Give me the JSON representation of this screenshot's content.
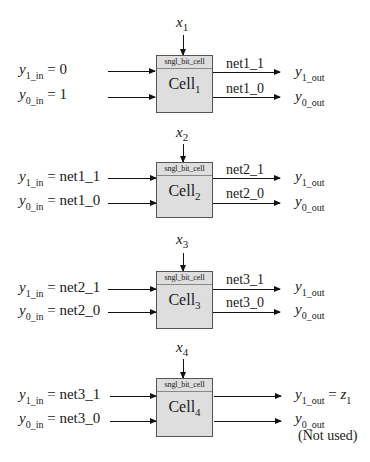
{
  "diagram": {
    "block_type": "sngl_bit_cell",
    "cells": [
      {
        "name": "Cell",
        "index": "1",
        "x_input": {
          "var": "x",
          "sub": "1"
        },
        "inputs": [
          {
            "var": "y",
            "sub": "1_in",
            "value": " = 0"
          },
          {
            "var": "y",
            "sub": "0_in",
            "value": " = 1"
          }
        ],
        "nets": [
          "net1_1",
          "net1_0"
        ],
        "outputs": [
          {
            "var": "y",
            "sub": "1_out",
            "suffix": ""
          },
          {
            "var": "y",
            "sub": "0_out",
            "suffix": ""
          }
        ]
      },
      {
        "name": "Cell",
        "index": "2",
        "x_input": {
          "var": "x",
          "sub": "2"
        },
        "inputs": [
          {
            "var": "y",
            "sub": "1_in",
            "value": " = net1_1"
          },
          {
            "var": "y",
            "sub": "0_in",
            "value": " = net1_0"
          }
        ],
        "nets": [
          "net2_1",
          "net2_0"
        ],
        "outputs": [
          {
            "var": "y",
            "sub": "1_out",
            "suffix": ""
          },
          {
            "var": "y",
            "sub": "0_out",
            "suffix": ""
          }
        ]
      },
      {
        "name": "Cell",
        "index": "3",
        "x_input": {
          "var": "x",
          "sub": "3"
        },
        "inputs": [
          {
            "var": "y",
            "sub": "1_in",
            "value": " = net2_1"
          },
          {
            "var": "y",
            "sub": "0_in",
            "value": " = net2_0"
          }
        ],
        "nets": [
          "net3_1",
          "net3_0"
        ],
        "outputs": [
          {
            "var": "y",
            "sub": "1_out",
            "suffix": ""
          },
          {
            "var": "y",
            "sub": "0_out",
            "suffix": ""
          }
        ]
      },
      {
        "name": "Cell",
        "index": "4",
        "x_input": {
          "var": "x",
          "sub": "4"
        },
        "inputs": [
          {
            "var": "y",
            "sub": "1_in",
            "value": " = net3_1"
          },
          {
            "var": "y",
            "sub": "0_in",
            "value": " = net3_0"
          }
        ],
        "nets": [
          "",
          ""
        ],
        "outputs": [
          {
            "var": "y",
            "sub": "1_out",
            "suffix": " = ",
            "suffix_var": "z",
            "suffix_sub": "1"
          },
          {
            "var": "y",
            "sub": "0_out",
            "suffix": ""
          }
        ],
        "note": "(Not used)"
      }
    ]
  },
  "colors": {
    "box_fill": "#dedede",
    "box_border": "#555555",
    "line": "#111111"
  }
}
